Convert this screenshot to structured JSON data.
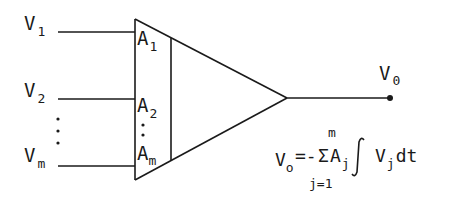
{
  "diagram": {
    "type": "summing integrator block",
    "colors": {
      "ink": "#1a1a1a",
      "background": "#ffffff"
    },
    "inputs": [
      {
        "label": "V",
        "subscript": "1",
        "gain_label": "A",
        "gain_subscript": "1"
      },
      {
        "label": "V",
        "subscript": "2",
        "gain_label": "A",
        "gain_subscript": "2"
      },
      {
        "label": "V",
        "subscript": "m",
        "gain_label": "A",
        "gain_subscript": "m"
      }
    ],
    "ellipsis": "⋮",
    "output": {
      "label": "V",
      "subscript": "0"
    },
    "equation": {
      "lhs": "V",
      "lhs_subscript": "o",
      "equals_minus": "=-",
      "sigma": "Σ",
      "upper_limit": "m",
      "lower_limit": "j=1",
      "coef": "A",
      "coef_subscript": "j",
      "integral": "∫",
      "integrand": "V",
      "integrand_subscript": "j",
      "differential": "dt"
    }
  }
}
